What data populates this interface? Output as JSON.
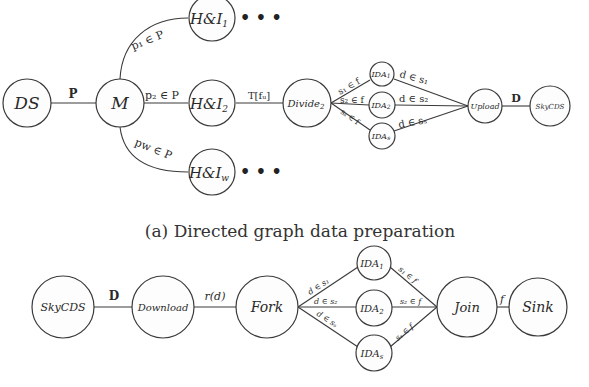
{
  "figure_a": {
    "caption": "(a) Directed graph data preparation",
    "nodes": {
      "ds": "DS",
      "m": "M",
      "hi1": "H&I",
      "hi1_sub": "1",
      "hi2": "H&I",
      "hi2_sub": "2",
      "hiw": "H&I",
      "hiw_sub": "w",
      "divide": "Divide",
      "divide_sub": "2",
      "ida1": "IDA",
      "ida1_sub": "1",
      "ida2": "IDA",
      "ida2_sub": "2",
      "idas": "IDA",
      "idas_sub": "s",
      "upload": "Upload",
      "skycds": "SkyCDS"
    },
    "ellipsis": "• • •",
    "edges": {
      "ds_m": "P",
      "m_hi1": "p₁ ∈ P",
      "m_hi2": "p₂ ∈ P",
      "m_hiw": "pw ∈ P",
      "hi2_divide": "T[fᵤ]",
      "divide_ida1": "s₁ ∈ f",
      "divide_ida2": "s₂ ∈ f",
      "divide_idas": "sₛ ∈ f",
      "ida1_upload": "d ∈ s₁",
      "ida2_upload": "d ∈ s₂",
      "idas_upload": "d ∈ sₛ",
      "upload_skycds": "D"
    }
  },
  "figure_b": {
    "nodes": {
      "skycds": "SkyCDS",
      "download": "Download",
      "fork": "Fork",
      "ida1": "IDA",
      "ida1_sub": "1",
      "ida2": "IDA",
      "ida2_sub": "2",
      "idas": "IDA",
      "idas_sub": "s",
      "join": "Join",
      "sink": "Sink"
    },
    "edges": {
      "skycds_download": "D",
      "download_fork": "r(d)",
      "fork_ida1": "d ∈ s₁",
      "fork_ida2": "d ∈ s₂",
      "fork_idas": "d ∈ sₛ",
      "ida1_join": "s₁ ∈ f",
      "ida2_join": "s₂ ∈ f",
      "idas_join": "sₛ ∈ f",
      "join_sink": "f"
    }
  }
}
